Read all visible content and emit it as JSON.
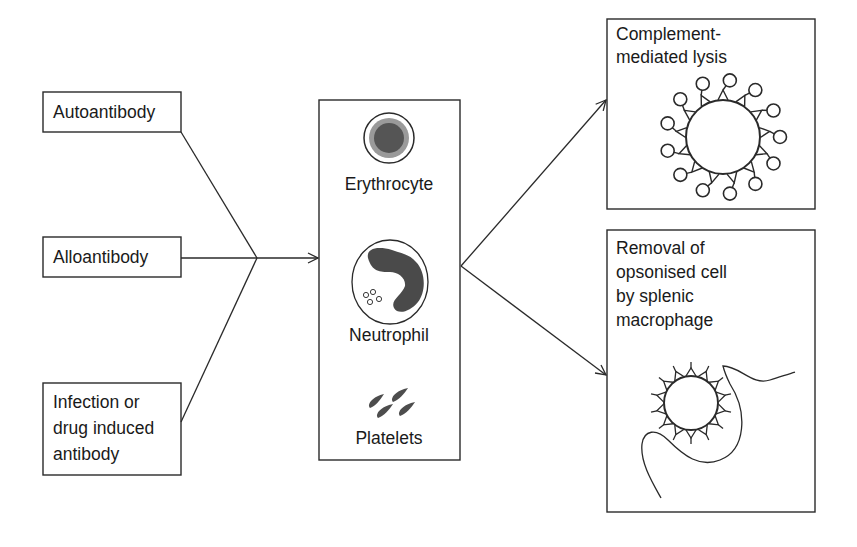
{
  "diagram": {
    "causes": [
      {
        "id": "autoantibody",
        "lines": [
          "Autoantibody"
        ]
      },
      {
        "id": "alloantibody",
        "lines": [
          "Alloantibody"
        ]
      },
      {
        "id": "infection-drug",
        "lines": [
          "Infection or",
          "drug induced",
          "antibody"
        ]
      }
    ],
    "targets": {
      "cells": [
        {
          "id": "erythrocyte",
          "label": "Erythrocyte"
        },
        {
          "id": "neutrophil",
          "label": "Neutrophil"
        },
        {
          "id": "platelets",
          "label": "Platelets"
        }
      ]
    },
    "outcomes": [
      {
        "id": "complement-lysis",
        "lines": [
          "Complement-",
          "mediated lysis"
        ]
      },
      {
        "id": "splenic-removal",
        "lines": [
          "Removal of",
          "opsonised cell",
          "by splenic",
          "macrophage"
        ]
      }
    ],
    "colors": {
      "stroke": "#2a2a2a",
      "erythrocyte_ring": "#9a9a9a",
      "erythrocyte_core": "#555555",
      "nucleus": "#4a4a4a",
      "platelet": "#4d4d4d"
    }
  }
}
